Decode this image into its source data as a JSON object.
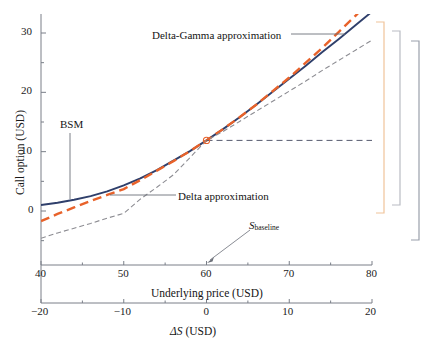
{
  "chart_data": {
    "type": "line",
    "title": "",
    "xlabel": "ΔS (USD)",
    "xlabel_secondary": "Underlying price (USD)",
    "ylabel": "Call option (USD)",
    "xlim": [
      -20,
      20
    ],
    "xlim_secondary": [
      40,
      80
    ],
    "ylim": [
      -6.2,
      33.5
    ],
    "grid": false,
    "legend_position": "inline-annotations",
    "x_ticks": [
      -20,
      -10,
      0,
      10,
      20
    ],
    "x_tick_labels": [
      "−20",
      "−10",
      "0",
      "10",
      "20"
    ],
    "x_ticks_secondary": [
      40,
      50,
      60,
      70,
      80
    ],
    "x_tick_labels_secondary": [
      "40",
      "50",
      "60",
      "70",
      "80"
    ],
    "y_ticks": [
      0,
      10,
      20,
      30
    ],
    "y_tick_labels": [
      "0",
      "10",
      "20",
      "30"
    ],
    "y_minor_ticks": [
      -5,
      5,
      15,
      25
    ],
    "x_minor_ticks": [
      -15,
      -5,
      5,
      15
    ],
    "x": [
      -20,
      -18,
      -16,
      -14,
      -12,
      -10,
      -8,
      -6,
      -4,
      -2,
      0,
      2,
      4,
      6,
      8,
      10,
      12,
      14,
      16,
      18,
      20
    ],
    "series": [
      {
        "name": "BSM",
        "style": "solid",
        "color": "#2f3f6b",
        "values": [
          1.0,
          1.4,
          1.9,
          2.5,
          3.3,
          4.3,
          5.5,
          6.9,
          8.5,
          10.1,
          11.9,
          13.8,
          15.8,
          17.9,
          20.1,
          22.3,
          24.5,
          26.8,
          29.0,
          31.3,
          33.6
        ]
      },
      {
        "name": "Delta-Gamma approximation",
        "style": "dashed",
        "color": "#e8622a",
        "values": [
          -1.7,
          -0.5,
          0.6,
          1.7,
          2.7,
          3.7,
          5.2,
          6.8,
          8.4,
          10.1,
          11.9,
          13.8,
          15.8,
          17.9,
          20.2,
          22.5,
          25.0,
          27.5,
          30.2,
          32.9,
          35.7
        ]
      },
      {
        "name": "Delta approximation",
        "style": "dashdot",
        "color": "#8c8c92",
        "values": [
          -4.6,
          -3.7,
          -2.9,
          -2.1,
          -1.2,
          -0.4,
          2.0,
          4.0,
          6.1,
          9.0,
          11.9,
          13.4,
          15.1,
          16.8,
          18.5,
          20.2,
          21.9,
          23.7,
          25.4,
          27.1,
          28.8
        ]
      }
    ],
    "baseline_marker": {
      "x": 0,
      "y": 11.9,
      "label": "S_baseline",
      "color": "#e8622a"
    },
    "baseline_hline": {
      "y": 11.9,
      "from_x": 0,
      "to_x": 20,
      "style": "dashed",
      "color": "#555a6e"
    },
    "annotations": [
      {
        "name": "delta-gamma-annotation",
        "text": "Delta-Gamma approximation"
      },
      {
        "name": "bsm-annotation",
        "text": "BSM"
      },
      {
        "name": "delta-annotation",
        "text": "Delta approximation"
      },
      {
        "name": "s-baseline-annotation",
        "text_main": "S",
        "text_sub": "baseline"
      }
    ],
    "brackets": [
      {
        "name": "bracket-orange",
        "color": "#f0c49a"
      },
      {
        "name": "bracket-gray-mid",
        "color": "#b9bcc4"
      },
      {
        "name": "bracket-gray-outer",
        "color": "#9aa0ab"
      }
    ]
  },
  "axes": {
    "y_title": "Call option (USD)",
    "x_title_top": "Underlying price (USD)",
    "x_title_bottom": "ΔS (USD)"
  },
  "colors": {
    "bsm": "#2f3f6b",
    "delta_gamma": "#e8622a",
    "delta": "#8c8c92",
    "axis": "#7a7f88",
    "text": "#141414",
    "bracket_orange": "#f0c49a",
    "bracket_gray": "#b9bcc4",
    "bracket_gray_dark": "#9aa0ab"
  }
}
